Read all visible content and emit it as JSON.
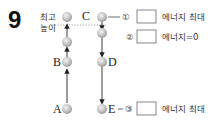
{
  "question_number": "9",
  "apex_label_line1": "최고",
  "apex_label_line2": "높이",
  "points": {
    "A": "A",
    "B": "B",
    "C": "C",
    "D": "D",
    "E": "E"
  },
  "answer_rows": [
    {
      "marker": "①",
      "text": "에너지 최대"
    },
    {
      "marker": "②",
      "text": "에너지=0"
    },
    {
      "marker": "③",
      "text": "에너지 최대"
    }
  ],
  "colors": {
    "ball": "#b8b8b8",
    "arrow": "#222222",
    "dotted_line": "#888888"
  }
}
